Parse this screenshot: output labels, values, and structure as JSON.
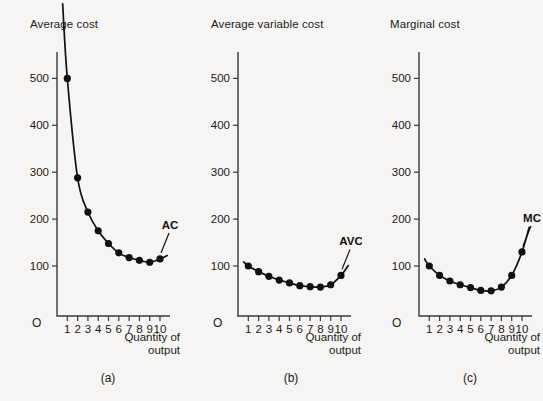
{
  "figure": {
    "background_color": "#f6f5f3",
    "ink_color": "#111111"
  },
  "chart_data": [
    {
      "type": "line",
      "title": "Average cost",
      "panel_caption": "(a)",
      "series_label": "AC",
      "xlabel": "Quantity of output",
      "ylabel": "",
      "origin_label": "O",
      "x": [
        1,
        2,
        3,
        4,
        5,
        6,
        7,
        8,
        9,
        10
      ],
      "categories": [
        "1",
        "2",
        "3",
        "4",
        "5",
        "6",
        "7",
        "8",
        "9",
        "10"
      ],
      "values": [
        500,
        288,
        215,
        175,
        148,
        128,
        118,
        112,
        108,
        115
      ],
      "xticklabels": [
        "1",
        "2",
        "3",
        "4",
        "5",
        "6",
        "7",
        "8",
        "9",
        "10"
      ],
      "yticklabels": [
        "100",
        "200",
        "300",
        "400",
        "500"
      ],
      "ytickvalues": [
        100,
        200,
        300,
        400,
        500
      ],
      "xlim": [
        0,
        11.6
      ],
      "ylim": [
        0,
        570
      ],
      "grid": false,
      "legend_position": "inline-right"
    },
    {
      "type": "line",
      "title": "Average variable cost",
      "panel_caption": "(b)",
      "series_label": "AVC",
      "xlabel": "Quantity of output",
      "ylabel": "",
      "origin_label": "O",
      "x": [
        1,
        2,
        3,
        4,
        5,
        6,
        7,
        8,
        9,
        10
      ],
      "categories": [
        "1",
        "2",
        "3",
        "4",
        "5",
        "6",
        "7",
        "8",
        "9",
        "10"
      ],
      "values": [
        100,
        88,
        78,
        70,
        64,
        58,
        56,
        55,
        60,
        80
      ],
      "xticklabels": [
        "1",
        "2",
        "3",
        "4",
        "5",
        "6",
        "7",
        "8",
        "9",
        "10"
      ],
      "yticklabels": [
        "100",
        "200",
        "300",
        "400",
        "500"
      ],
      "ytickvalues": [
        100,
        200,
        300,
        400,
        500
      ],
      "xlim": [
        0,
        11.6
      ],
      "ylim": [
        0,
        570
      ],
      "grid": false,
      "legend_position": "inline-right"
    },
    {
      "type": "line",
      "title": "Marginal cost",
      "panel_caption": "(c)",
      "series_label": "MC",
      "xlabel": "Quantity of output",
      "ylabel": "",
      "origin_label": "O",
      "x": [
        1,
        2,
        3,
        4,
        5,
        6,
        7,
        8,
        9,
        10
      ],
      "categories": [
        "1",
        "2",
        "3",
        "4",
        "5",
        "6",
        "7",
        "8",
        "9",
        "10"
      ],
      "values": [
        100,
        80,
        68,
        60,
        54,
        48,
        47,
        55,
        80,
        130
      ],
      "xticklabels": [
        "1",
        "2",
        "3",
        "4",
        "5",
        "6",
        "7",
        "8",
        "9",
        "10"
      ],
      "yticklabels": [
        "100",
        "200",
        "300",
        "400",
        "500"
      ],
      "ytickvalues": [
        100,
        200,
        300,
        400,
        500
      ],
      "xlim": [
        0,
        11.6
      ],
      "ylim": [
        0,
        570
      ],
      "grid": false,
      "legend_position": "inline-right"
    }
  ],
  "panels": [
    {
      "title": "Average cost",
      "caption": "(a)",
      "curve_label": "AC",
      "origin": "O",
      "xaxis_line1": "Quantity of",
      "xaxis_line2": "output"
    },
    {
      "title": "Average variable cost",
      "caption": "(b)",
      "curve_label": "AVC",
      "origin": "O",
      "xaxis_line1": "Quantity of",
      "xaxis_line2": "output"
    },
    {
      "title": "Marginal cost",
      "caption": "(c)",
      "curve_label": "MC",
      "origin": "O",
      "xaxis_line1": "Quantity of",
      "xaxis_line2": "output"
    }
  ]
}
